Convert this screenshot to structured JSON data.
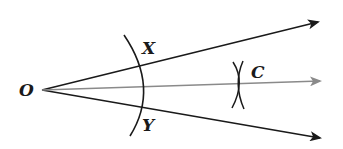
{
  "diagram": {
    "labels": {
      "vertex": "O",
      "point_x": "X",
      "point_y": "Y",
      "point_c": "C"
    },
    "colors": {
      "ray": "#1a1a1a",
      "bisector": "#8a8a8a",
      "arc": "#1a1a1a",
      "background": "#ffffff"
    }
  }
}
